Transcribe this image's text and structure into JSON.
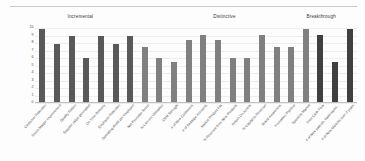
{
  "chart_data": {
    "type": "bar",
    "title": "",
    "xlabel": "",
    "ylabel": "",
    "ylim": [
      0,
      10
    ],
    "grid": true,
    "legend_position": "none",
    "y_ticks": [
      "10",
      "9",
      "8",
      "7",
      "6",
      "5",
      "4",
      "3",
      "2",
      "1",
      "0"
    ],
    "group_labels": [
      {
        "label": "Incremental",
        "center_pct": 22
      },
      {
        "label": "Distinctive",
        "center_pct": 61.5
      },
      {
        "label": "Breakthrough",
        "center_pct": 88
      }
    ],
    "series": [
      {
        "name": "Incremental",
        "color": "#595959",
        "points": [
          {
            "category": "Customer Retention",
            "value": 10
          },
          {
            "category": "Gross Margin Improvement",
            "value": 8
          },
          {
            "category": "Quality Return",
            "value": 9
          },
          {
            "category": "Supplier value generated",
            "value": 6
          },
          {
            "category": "On Time Delivery",
            "value": 9
          },
          {
            "category": "Employee Retention",
            "value": 8
          },
          {
            "category": "Operating Profit per employee",
            "value": 9
          }
        ]
      },
      {
        "name": "Distinctive",
        "color": "#808080",
        "points": [
          {
            "category": "Net Promoter Score",
            "value": 7.5
          },
          {
            "category": "% Licence Utilization",
            "value": 6
          },
          {
            "category": "CRM Strength",
            "value": 5.5
          },
          {
            "category": "# of New Customers",
            "value": 8.5
          },
          {
            "category": "# of Strategic Accounts",
            "value": 9.2
          },
          {
            "category": "Market Product Fits",
            "value": 8.5
          },
          {
            "category": "% Revenue from New Products",
            "value": 6
          },
          {
            "category": "Return On Assets",
            "value": 6
          },
          {
            "category": "% Capital to Revenue",
            "value": 9.2
          },
          {
            "category": "Brand Awareness",
            "value": 7.5
          },
          {
            "category": "Innovation Pipeline",
            "value": 7.5
          },
          {
            "category": "Speed to Market",
            "value": 10
          }
        ]
      },
      {
        "name": "Breakthrough",
        "color": "#404040",
        "points": [
          {
            "category": "Free Cash Flow",
            "value": 9.2
          },
          {
            "category": "# of New patents, trademarks...",
            "value": 5.5
          },
          {
            "category": "# of New Markets over 3 years",
            "value": 10
          }
        ]
      }
    ]
  }
}
